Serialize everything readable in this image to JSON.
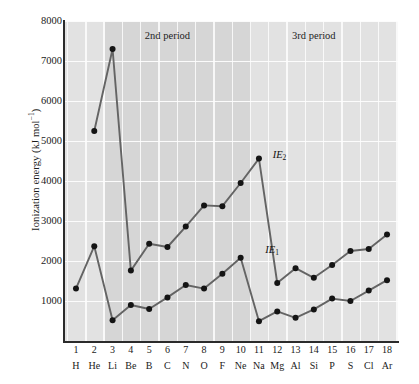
{
  "chart_data": {
    "type": "line",
    "title": "",
    "xlabel": "",
    "ylabel": "Ionization energy (kJ mol⁻¹)",
    "ylabel_main": "Ionization energy (kJ mol",
    "ylabel_sup": "−1",
    "ylabel_tail": ")",
    "ylim": [
      0,
      8000
    ],
    "xlim": [
      0.4,
      18.6
    ],
    "grid": true,
    "legend_position": "inline-annotation",
    "yticks": [
      1000,
      2000,
      3000,
      4000,
      5000,
      6000,
      7000,
      8000
    ],
    "ytick_labels": [
      "1000",
      "2000",
      "3000",
      "4000",
      "5000",
      "6000",
      "7000",
      "8000"
    ],
    "atomic_numbers": [
      1,
      2,
      3,
      4,
      5,
      6,
      7,
      8,
      9,
      10,
      11,
      12,
      13,
      14,
      15,
      16,
      17,
      18
    ],
    "categories": [
      "H",
      "He",
      "Li",
      "Be",
      "B",
      "C",
      "N",
      "O",
      "F",
      "Ne",
      "Na",
      "Mg",
      "Al",
      "Si",
      "P",
      "S",
      "Cl",
      "Ar"
    ],
    "series": [
      {
        "name": "IE1",
        "label": "IE",
        "label_sub": "1",
        "x": [
          1,
          2,
          3,
          4,
          5,
          6,
          7,
          8,
          9,
          10,
          11,
          12,
          13,
          14,
          15,
          16,
          17,
          18
        ],
        "values": [
          1310,
          2370,
          520,
          900,
          800,
          1090,
          1400,
          1310,
          1680,
          2080,
          495,
          740,
          580,
          790,
          1060,
          1000,
          1260,
          1520
        ]
      },
      {
        "name": "IE2",
        "label": "IE",
        "label_sub": "2",
        "x": [
          2,
          3,
          4,
          5,
          6,
          7,
          8,
          9,
          10,
          11,
          12,
          13,
          14,
          15,
          16,
          17,
          18
        ],
        "values": [
          5250,
          7300,
          1760,
          2430,
          2350,
          2860,
          3390,
          3370,
          3950,
          4560,
          1450,
          1820,
          1580,
          1900,
          2250,
          2300,
          2660
        ]
      }
    ],
    "annotations": [
      {
        "text": "2nd period",
        "x": 6.0,
        "y": 7600
      },
      {
        "text": "3rd period",
        "x": 14.0,
        "y": 7600
      }
    ],
    "bands": [
      {
        "label": "1st period",
        "from": 0.4,
        "to": 2.6
      },
      {
        "label": "2nd period",
        "from": 2.6,
        "to": 10.55
      },
      {
        "label": "3rd period",
        "from": 10.55,
        "to": 18.6
      }
    ],
    "colors": {
      "plot_background": "#e2e2e2",
      "band_2nd_period": "#d6d6d6",
      "gridline": "#fdfdfd",
      "line": "#646464",
      "marker": "#141414",
      "axis": "#2b2b2b",
      "text": "#1a1a1a"
    }
  }
}
